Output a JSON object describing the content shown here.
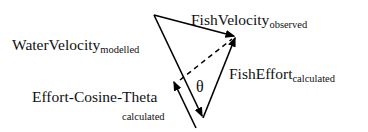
{
  "diagram": {
    "colors": {
      "line": "#000000",
      "text": "#111111",
      "background": "#ffffff"
    },
    "labels": {
      "water_velocity": {
        "main": "WaterVelocity",
        "sub": "modelled"
      },
      "fish_velocity": {
        "main": "FishVelocity",
        "sub": "observed"
      },
      "fish_effort": {
        "main": "FishEffort",
        "sub": "calculated"
      },
      "effort_cosine_theta": {
        "main": "Effort-Cosine-Theta",
        "sub": "calculated"
      },
      "angle": "θ"
    },
    "vectors": [
      {
        "name": "water-velocity",
        "from": [
          154,
          15
        ],
        "to": [
          203,
          118
        ],
        "style": "solid",
        "arrow": "end"
      },
      {
        "name": "fish-velocity",
        "from": [
          154,
          15
        ],
        "to": [
          236,
          36
        ],
        "style": "solid",
        "arrow": "end"
      },
      {
        "name": "fish-effort",
        "from": [
          203,
          118
        ],
        "to": [
          236,
          36
        ],
        "style": "solid",
        "arrow": "end"
      },
      {
        "name": "projection",
        "from": [
          180,
          80
        ],
        "to": [
          236,
          36
        ],
        "style": "dashed",
        "arrow": "none"
      },
      {
        "name": "effort-cosine-theta",
        "from": [
          196,
          128
        ],
        "to": [
          173,
          80
        ],
        "style": "solid",
        "arrow": "end"
      }
    ]
  }
}
